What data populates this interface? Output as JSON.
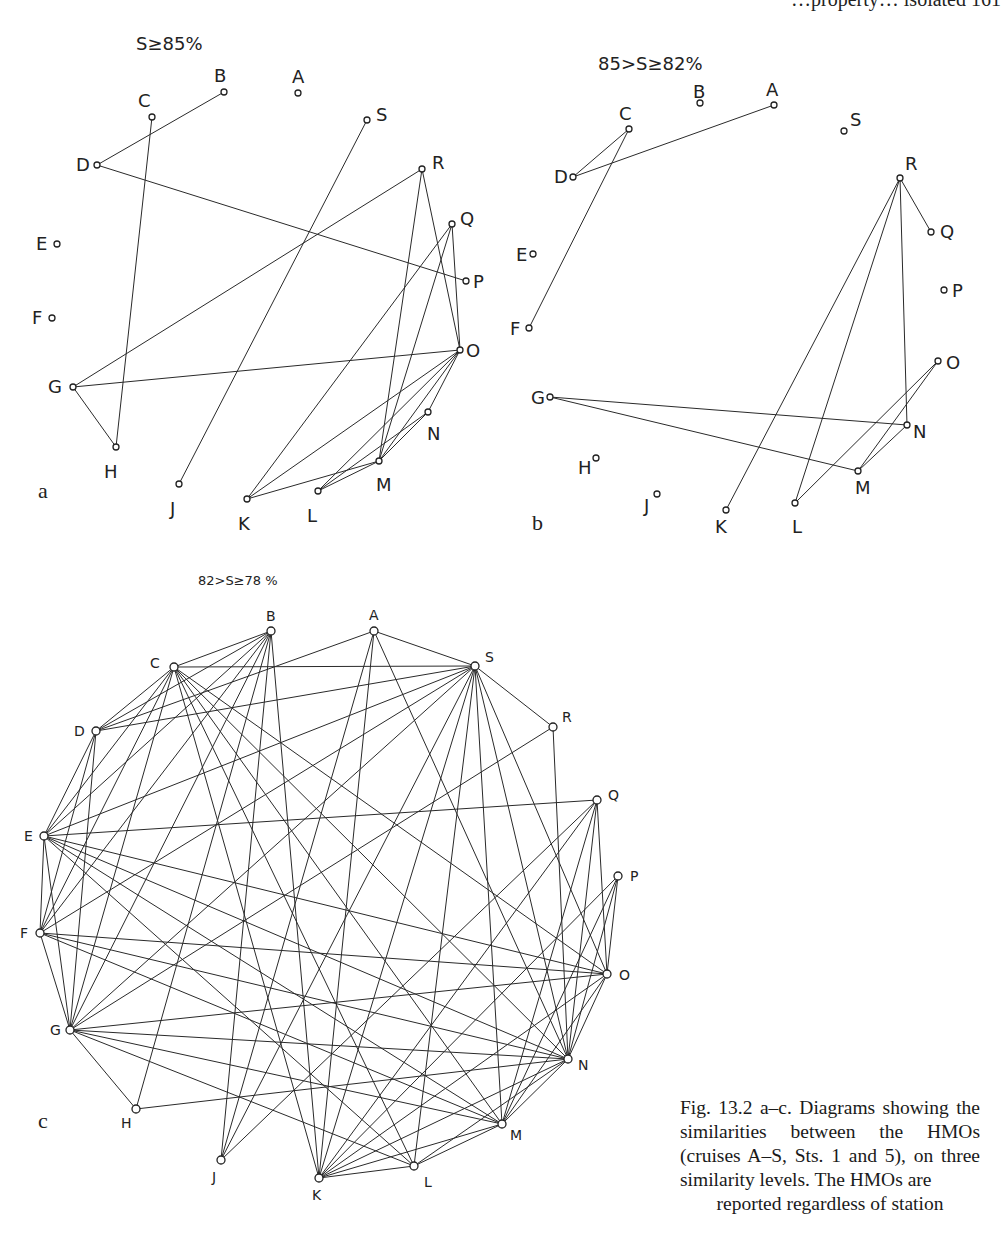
{
  "running_head": "…property… isolated  161",
  "caption": {
    "text": "Fig. 13.2 a–c. Diagrams showing the similarities between the HMOs (cruises A–S, Sts. 1 and 5), on three similarity levels. The HMOs are",
    "last_line": "reported regardless of station"
  },
  "panels": [
    {
      "id": "a",
      "letter": "a",
      "letter_pos": [
        38,
        498
      ],
      "threshold": "S≥85%",
      "threshold_pos": [
        136,
        50
      ],
      "threshold_size": 18,
      "label_size": 18,
      "node_r": 3,
      "nodes": {
        "A": {
          "x": 298,
          "y": 93,
          "lx": 292,
          "ly": 83
        },
        "B": {
          "x": 224,
          "y": 92,
          "lx": 214,
          "ly": 82
        },
        "C": {
          "x": 152,
          "y": 117,
          "lx": 138,
          "ly": 107
        },
        "D": {
          "x": 97,
          "y": 165,
          "lx": 76,
          "ly": 171
        },
        "E": {
          "x": 57,
          "y": 244,
          "lx": 36,
          "ly": 250
        },
        "F": {
          "x": 52,
          "y": 318,
          "lx": 32,
          "ly": 324
        },
        "G": {
          "x": 73,
          "y": 387,
          "lx": 48,
          "ly": 393
        },
        "H": {
          "x": 116,
          "y": 447,
          "lx": 104,
          "ly": 478
        },
        "J": {
          "x": 179,
          "y": 484,
          "lx": 170,
          "ly": 515
        },
        "K": {
          "x": 247,
          "y": 499,
          "lx": 238,
          "ly": 530
        },
        "L": {
          "x": 318,
          "y": 491,
          "lx": 307,
          "ly": 522
        },
        "M": {
          "x": 379,
          "y": 461,
          "lx": 376,
          "ly": 491
        },
        "N": {
          "x": 428,
          "y": 412,
          "lx": 427,
          "ly": 440
        },
        "O": {
          "x": 460,
          "y": 350,
          "lx": 466,
          "ly": 357
        },
        "P": {
          "x": 466,
          "y": 281,
          "lx": 473,
          "ly": 288
        },
        "Q": {
          "x": 452,
          "y": 224,
          "lx": 460,
          "ly": 225
        },
        "R": {
          "x": 422,
          "y": 169,
          "lx": 432,
          "ly": 169
        },
        "S": {
          "x": 367,
          "y": 120,
          "lx": 376,
          "ly": 121
        }
      },
      "edges": [
        [
          "B",
          "D"
        ],
        [
          "C",
          "H"
        ],
        [
          "D",
          "P"
        ],
        [
          "G",
          "R"
        ],
        [
          "G",
          "O"
        ],
        [
          "G",
          "H"
        ],
        [
          "S",
          "J"
        ],
        [
          "R",
          "M"
        ],
        [
          "R",
          "O"
        ],
        [
          "Q",
          "K"
        ],
        [
          "Q",
          "M"
        ],
        [
          "Q",
          "O"
        ],
        [
          "O",
          "K"
        ],
        [
          "O",
          "M"
        ],
        [
          "O",
          "L"
        ],
        [
          "O",
          "N"
        ],
        [
          "N",
          "L"
        ],
        [
          "K",
          "M"
        ],
        [
          "L",
          "M"
        ],
        [
          "N",
          "M"
        ]
      ]
    },
    {
      "id": "b",
      "letter": "b",
      "letter_pos": [
        532,
        530
      ],
      "threshold": "85>S≥82%",
      "threshold_pos": [
        598,
        70
      ],
      "threshold_size": 18,
      "label_size": 18,
      "node_r": 3,
      "nodes": {
        "A": {
          "x": 774,
          "y": 105,
          "lx": 766,
          "ly": 96
        },
        "B": {
          "x": 700,
          "y": 103,
          "lx": 693,
          "ly": 98
        },
        "C": {
          "x": 629,
          "y": 129,
          "lx": 619,
          "ly": 120
        },
        "D": {
          "x": 573,
          "y": 177,
          "lx": 554,
          "ly": 183
        },
        "E": {
          "x": 533,
          "y": 254,
          "lx": 516,
          "ly": 261
        },
        "F": {
          "x": 529,
          "y": 328,
          "lx": 510,
          "ly": 335
        },
        "G": {
          "x": 550,
          "y": 397,
          "lx": 531,
          "ly": 404
        },
        "H": {
          "x": 596,
          "y": 458,
          "lx": 578,
          "ly": 474
        },
        "J": {
          "x": 657,
          "y": 494,
          "lx": 644,
          "ly": 512
        },
        "K": {
          "x": 726,
          "y": 510,
          "lx": 715,
          "ly": 533
        },
        "L": {
          "x": 795,
          "y": 503,
          "lx": 792,
          "ly": 533
        },
        "M": {
          "x": 858,
          "y": 471,
          "lx": 855,
          "ly": 494
        },
        "N": {
          "x": 907,
          "y": 425,
          "lx": 913,
          "ly": 438
        },
        "O": {
          "x": 938,
          "y": 361,
          "lx": 946,
          "ly": 369
        },
        "P": {
          "x": 944,
          "y": 290,
          "lx": 952,
          "ly": 297
        },
        "Q": {
          "x": 931,
          "y": 232,
          "lx": 940,
          "ly": 238
        },
        "R": {
          "x": 900,
          "y": 178,
          "lx": 905,
          "ly": 170
        },
        "S": {
          "x": 844,
          "y": 131,
          "lx": 850,
          "ly": 126
        }
      },
      "edges": [
        [
          "C",
          "D"
        ],
        [
          "D",
          "A"
        ],
        [
          "C",
          "F"
        ],
        [
          "R",
          "Q"
        ],
        [
          "R",
          "K"
        ],
        [
          "R",
          "L"
        ],
        [
          "R",
          "N"
        ],
        [
          "G",
          "N"
        ],
        [
          "G",
          "M"
        ],
        [
          "O",
          "L"
        ],
        [
          "O",
          "M"
        ],
        [
          "N",
          "M"
        ]
      ]
    },
    {
      "id": "c",
      "letter": "c",
      "letter_pos": [
        38,
        1128
      ],
      "threshold": "82>S≥78 %",
      "threshold_pos": [
        198,
        585
      ],
      "threshold_size": 13,
      "label_size": 14,
      "node_r": 4,
      "nodes": {
        "A": {
          "x": 374,
          "y": 631,
          "lx": 369,
          "ly": 620
        },
        "B": {
          "x": 271,
          "y": 631,
          "lx": 266,
          "ly": 621
        },
        "C": {
          "x": 174,
          "y": 667,
          "lx": 150,
          "ly": 668
        },
        "D": {
          "x": 96,
          "y": 731,
          "lx": 74,
          "ly": 736
        },
        "E": {
          "x": 44,
          "y": 836,
          "lx": 24,
          "ly": 841
        },
        "F": {
          "x": 40,
          "y": 933,
          "lx": 20,
          "ly": 938
        },
        "G": {
          "x": 70,
          "y": 1030,
          "lx": 50,
          "ly": 1035
        },
        "H": {
          "x": 136,
          "y": 1109,
          "lx": 121,
          "ly": 1128
        },
        "J": {
          "x": 221,
          "y": 1160,
          "lx": 212,
          "ly": 1182
        },
        "K": {
          "x": 319,
          "y": 1178,
          "lx": 312,
          "ly": 1200
        },
        "L": {
          "x": 414,
          "y": 1166,
          "lx": 424,
          "ly": 1187
        },
        "M": {
          "x": 502,
          "y": 1124,
          "lx": 510,
          "ly": 1140
        },
        "N": {
          "x": 568,
          "y": 1059,
          "lx": 578,
          "ly": 1070
        },
        "O": {
          "x": 607,
          "y": 974,
          "lx": 619,
          "ly": 980
        },
        "P": {
          "x": 618,
          "y": 876,
          "lx": 630,
          "ly": 881
        },
        "Q": {
          "x": 597,
          "y": 800,
          "lx": 608,
          "ly": 800
        },
        "R": {
          "x": 553,
          "y": 727,
          "lx": 562,
          "ly": 722
        },
        "S": {
          "x": 475,
          "y": 666,
          "lx": 485,
          "ly": 662
        }
      },
      "edges": [
        [
          "A",
          "S"
        ],
        [
          "A",
          "D"
        ],
        [
          "A",
          "J"
        ],
        [
          "A",
          "N"
        ],
        [
          "A",
          "K"
        ],
        [
          "B",
          "C"
        ],
        [
          "B",
          "D"
        ],
        [
          "B",
          "E"
        ],
        [
          "B",
          "F"
        ],
        [
          "B",
          "G"
        ],
        [
          "B",
          "H"
        ],
        [
          "B",
          "J"
        ],
        [
          "B",
          "K"
        ],
        [
          "C",
          "S"
        ],
        [
          "C",
          "D"
        ],
        [
          "C",
          "E"
        ],
        [
          "C",
          "F"
        ],
        [
          "C",
          "G"
        ],
        [
          "C",
          "K"
        ],
        [
          "C",
          "L"
        ],
        [
          "C",
          "M"
        ],
        [
          "C",
          "N"
        ],
        [
          "C",
          "O"
        ],
        [
          "D",
          "S"
        ],
        [
          "D",
          "E"
        ],
        [
          "D",
          "G"
        ],
        [
          "D",
          "F"
        ],
        [
          "E",
          "F"
        ],
        [
          "E",
          "G"
        ],
        [
          "E",
          "S"
        ],
        [
          "E",
          "Q"
        ],
        [
          "E",
          "L"
        ],
        [
          "E",
          "M"
        ],
        [
          "E",
          "N"
        ],
        [
          "E",
          "O"
        ],
        [
          "F",
          "G"
        ],
        [
          "F",
          "S"
        ],
        [
          "F",
          "O"
        ],
        [
          "F",
          "N"
        ],
        [
          "F",
          "M"
        ],
        [
          "G",
          "H"
        ],
        [
          "G",
          "S"
        ],
        [
          "G",
          "R"
        ],
        [
          "G",
          "N"
        ],
        [
          "G",
          "M"
        ],
        [
          "G",
          "L"
        ],
        [
          "G",
          "O"
        ],
        [
          "H",
          "N"
        ],
        [
          "J",
          "S"
        ],
        [
          "J",
          "Q"
        ],
        [
          "K",
          "S"
        ],
        [
          "K",
          "L"
        ],
        [
          "K",
          "M"
        ],
        [
          "K",
          "N"
        ],
        [
          "K",
          "O"
        ],
        [
          "K",
          "Q"
        ],
        [
          "K",
          "P"
        ],
        [
          "L",
          "M"
        ],
        [
          "L",
          "S"
        ],
        [
          "L",
          "N"
        ],
        [
          "M",
          "N"
        ],
        [
          "M",
          "O"
        ],
        [
          "M",
          "Q"
        ],
        [
          "M",
          "P"
        ],
        [
          "M",
          "S"
        ],
        [
          "N",
          "O"
        ],
        [
          "N",
          "Q"
        ],
        [
          "N",
          "R"
        ],
        [
          "N",
          "P"
        ],
        [
          "O",
          "Q"
        ],
        [
          "O",
          "P"
        ],
        [
          "S",
          "R"
        ],
        [
          "S",
          "N"
        ],
        [
          "S",
          "O"
        ]
      ]
    }
  ]
}
